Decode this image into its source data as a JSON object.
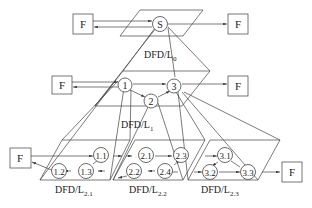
{
  "diagram": {
    "external_entity_label": "F",
    "levels": [
      {
        "name": "DFD/L",
        "sub": "0",
        "processes": [
          "S"
        ]
      },
      {
        "name": "DFD/L",
        "sub": "1",
        "processes": [
          "1",
          "2",
          "3"
        ]
      },
      {
        "name": "DFD/L",
        "sub": "2.1",
        "processes": [
          "1.1",
          "1.2",
          "1.3"
        ]
      },
      {
        "name": "DFD/L",
        "sub": "2.2",
        "processes": [
          "2.1",
          "2.2",
          "2.3",
          "2.4"
        ]
      },
      {
        "name": "DFD/L",
        "sub": "2.3",
        "processes": [
          "3.1",
          "3.2",
          "3.3"
        ]
      }
    ],
    "labels": {
      "F": "F",
      "S": "S",
      "p1": "1",
      "p2": "2",
      "p3": "3",
      "p11": "1.1",
      "p12": "1.2",
      "p13": "1.3",
      "p21": "2.1",
      "p22": "2.2",
      "p23": "2.3",
      "p24": "2.4",
      "p31": "3.1",
      "p32": "3.2",
      "p33": "3.3",
      "L0": "DFD/L",
      "L0sub": "0",
      "L1": "DFD/L",
      "L1sub": "1",
      "L21": "DFD/L",
      "L21sub": "2.1",
      "L22": "DFD/L",
      "L22sub": "2.2",
      "L23": "DFD/L",
      "L23sub": "2.3"
    }
  }
}
